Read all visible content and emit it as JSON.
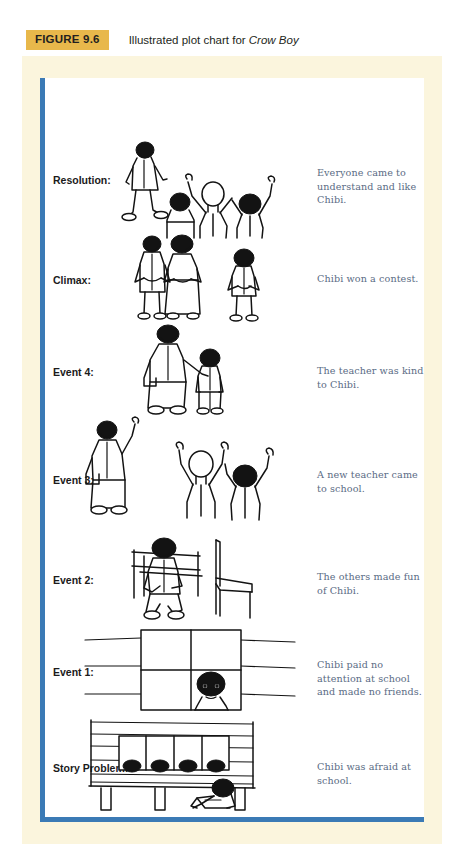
{
  "figure": {
    "tag": "FIGURE 9.6",
    "caption_prefix": "Illustrated plot chart for ",
    "caption_title": "Crow Boy"
  },
  "colors": {
    "tag_background": "#e8b84b",
    "frame_cream": "#fbf5dd",
    "plate_white": "#ffffff",
    "accent_blue": "#3b7ab5",
    "note_text": "#5a6b84",
    "label_text": "#1b1b1b",
    "ink": "#131313"
  },
  "plot_chart": {
    "rows": [
      {
        "label": "Resolution:",
        "note": "Everyone came to understand and like Chibi.",
        "art": "chibi-walking-past-three-cheering-children"
      },
      {
        "label": "Climax:",
        "note": "Chibi won a contest.",
        "art": "two-adults-and-child-applauding"
      },
      {
        "label": "Event 4:",
        "note": "The teacher was kind to Chibi.",
        "art": "teacher-with-arm-around-chibi"
      },
      {
        "label": "Event 3:",
        "note": "A new teacher came to school.",
        "art": "new-teacher-waving-and-two-children-with-arms-raised"
      },
      {
        "label": "Event 2:",
        "note": "The others made fun of Chibi.",
        "art": "chibi-sitting-alone-beside-empty-chair"
      },
      {
        "label": "Event 1:",
        "note": "Chibi paid no attention at school and made no friends.",
        "art": "chibi-face-in-window-pane"
      },
      {
        "label": "Story Problem:",
        "note": "Chibi was afraid at school.",
        "art": "schoolhouse-with-chibi-hiding-underneath"
      }
    ]
  }
}
